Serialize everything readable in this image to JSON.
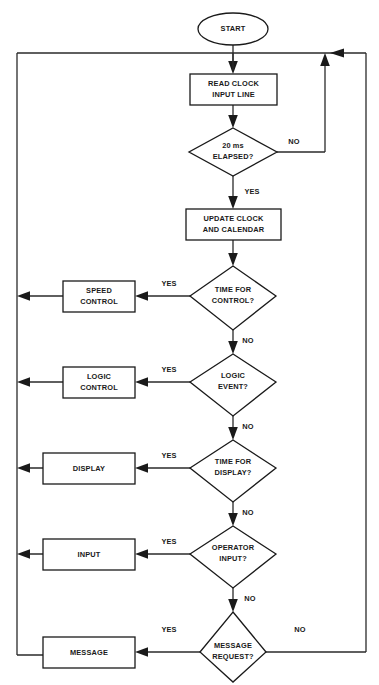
{
  "diagram": {
    "type": "flowchart",
    "canvas": {
      "width": 379,
      "height": 685
    },
    "colors": {
      "background": "#ffffff",
      "stroke": "#1a1a1a",
      "text": "#1a1a1a",
      "connector": "#2a2a2a"
    }
  },
  "nodes": {
    "start": {
      "shape": "terminator",
      "label": "START"
    },
    "read_clock": {
      "shape": "process",
      "line1": "READ CLOCK",
      "line2": "INPUT LINE"
    },
    "elapsed": {
      "shape": "decision",
      "line1": "20 ms",
      "line2": "ELAPSED?"
    },
    "update_clock": {
      "shape": "process",
      "line1": "UPDATE CLOCK",
      "line2": "AND CALENDAR"
    },
    "time_for_control": {
      "shape": "decision",
      "line1": "TIME FOR",
      "line2": "CONTROL?"
    },
    "speed_control": {
      "shape": "process",
      "line1": "SPEED",
      "line2": "CONTROL"
    },
    "logic_event": {
      "shape": "decision",
      "line1": "LOGIC",
      "line2": "EVENT?"
    },
    "logic_control": {
      "shape": "process",
      "line1": "LOGIC",
      "line2": "CONTROL"
    },
    "time_for_display": {
      "shape": "decision",
      "line1": "TIME FOR",
      "line2": "DISPLAY?"
    },
    "display": {
      "shape": "process",
      "line1": "DISPLAY",
      "line2": ""
    },
    "operator_input": {
      "shape": "decision",
      "line1": "OPERATOR",
      "line2": "INPUT?"
    },
    "input": {
      "shape": "process",
      "line1": "INPUT",
      "line2": ""
    },
    "message_request": {
      "shape": "decision",
      "line1": "MESSAGE",
      "line2": "REQUEST?"
    },
    "message": {
      "shape": "process",
      "line1": "MESSAGE",
      "line2": ""
    }
  },
  "edge_labels": {
    "elapsed_no": "NO",
    "elapsed_yes": "YES",
    "control_yes": "YES",
    "control_no": "NO",
    "logic_yes": "YES",
    "logic_no": "NO",
    "display_yes": "YES",
    "display_no": "NO",
    "operator_yes": "YES",
    "operator_no": "NO",
    "message_yes": "YES",
    "message_no": "NO"
  }
}
